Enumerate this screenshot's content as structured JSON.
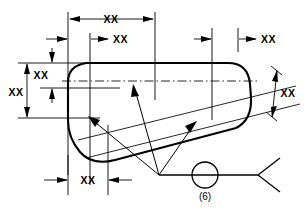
{
  "drawing": {
    "title": "Welded part outline with dimensions",
    "background_color": "#ffffff",
    "line_color": "#000000",
    "dimensions": {
      "top_overall_label": "XX",
      "top_inner_label": "XX",
      "top_right_label": "XX",
      "left_upper_label": "XX",
      "left_lower_label": "XX",
      "right_angled_label": "XX",
      "bottom_label": "XX"
    },
    "weld_symbol": {
      "all_around_icon": "weld-all-around-circle",
      "quantity_label": "(6)",
      "tail_icon": "weld-tail-fork",
      "reference_line_icon": "weld-reference-line"
    }
  }
}
